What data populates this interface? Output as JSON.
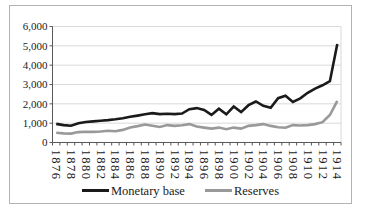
{
  "figure": {
    "background": "#ffffff",
    "border_color": "#b3b3b3"
  },
  "chart_data": {
    "type": "line",
    "title": "",
    "xlabel": "",
    "ylabel": "",
    "x": [
      1876,
      1877,
      1878,
      1879,
      1880,
      1881,
      1882,
      1883,
      1884,
      1885,
      1886,
      1887,
      1888,
      1889,
      1890,
      1891,
      1892,
      1893,
      1894,
      1895,
      1896,
      1897,
      1898,
      1899,
      1900,
      1901,
      1902,
      1903,
      1904,
      1905,
      1906,
      1907,
      1908,
      1909,
      1910,
      1911,
      1912,
      1913,
      1914
    ],
    "x_tick_labels": [
      "1876",
      "1878",
      "1880",
      "1882",
      "1884",
      "1886",
      "1888",
      "1890",
      "1892",
      "1894",
      "1896",
      "1898",
      "1900",
      "1902",
      "1904",
      "1906",
      "1908",
      "1910",
      "1912",
      "1914"
    ],
    "y_ticks": [
      0,
      1000,
      2000,
      3000,
      4000,
      5000,
      6000
    ],
    "y_tick_labels": [
      "0",
      "1,000",
      "2,000",
      "3,000",
      "4,000",
      "5,000",
      "6,000"
    ],
    "ylim": [
      0,
      6000
    ],
    "grid": "horizontal",
    "gridline_color": "#d9d9d9",
    "axis_color": "#595959",
    "label_color": "#1a1a1a",
    "legend_position": "bottom",
    "series": [
      {
        "name": "Monetary base",
        "color": "#1a1a1a",
        "values": [
          960,
          900,
          870,
          1000,
          1060,
          1090,
          1130,
          1160,
          1200,
          1250,
          1330,
          1390,
          1460,
          1520,
          1470,
          1490,
          1470,
          1500,
          1720,
          1780,
          1680,
          1430,
          1750,
          1460,
          1860,
          1570,
          1930,
          2120,
          1900,
          1800,
          2290,
          2420,
          2100,
          2280,
          2570,
          2790,
          2960,
          3170,
          5100
        ]
      },
      {
        "name": "Reserves",
        "color": "#999999",
        "values": [
          500,
          470,
          460,
          540,
          560,
          550,
          570,
          610,
          580,
          650,
          780,
          850,
          930,
          870,
          800,
          900,
          860,
          890,
          950,
          830,
          770,
          720,
          770,
          690,
          770,
          720,
          860,
          900,
          950,
          860,
          790,
          760,
          900,
          880,
          900,
          950,
          1050,
          1420,
          2150
        ]
      }
    ]
  }
}
